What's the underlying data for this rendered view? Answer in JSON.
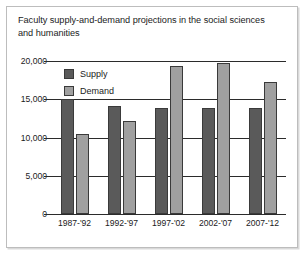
{
  "figure": {
    "title": "Faculty supply-and-demand projections in the social sciences and humanities"
  },
  "legend": {
    "position": "inside-top-left",
    "entries": [
      {
        "label": "Supply",
        "color": "#5a5a5a"
      },
      {
        "label": "Demand",
        "color": "#a0a0a0"
      }
    ]
  },
  "axes": {
    "y_tick_labels": [
      "20,000",
      "15,000",
      "10,000",
      "5,000",
      "0"
    ],
    "x_tick_labels": [
      "1987-'92",
      "1992-'97",
      "1997-'02",
      "2002-'07",
      "2007-'12"
    ]
  },
  "colors": {
    "supply": "#5a5a5a",
    "demand": "#a0a0a0",
    "bar_outline": "#3a3a3a",
    "axis": "#2b2b2b",
    "text": "#1b1b1b",
    "card_border": "#bdbdbd",
    "background": "#ffffff"
  },
  "chart_data": {
    "type": "bar",
    "title": "Faculty supply-and-demand projections in the social sciences and humanities",
    "xlabel": "",
    "ylabel": "",
    "ylim": [
      0,
      20000
    ],
    "yticks": [
      0,
      5000,
      10000,
      15000,
      20000
    ],
    "grid": true,
    "legend_position": "inside-top-left",
    "categories": [
      "1987-'92",
      "1992-'97",
      "1997-'02",
      "2002-'07",
      "2007-'12"
    ],
    "series": [
      {
        "name": "Supply",
        "color": "#5a5a5a",
        "values": [
          15000,
          14100,
          13800,
          13800,
          13900
        ]
      },
      {
        "name": "Demand",
        "color": "#a0a0a0",
        "values": [
          10500,
          12100,
          19300,
          19700,
          17300
        ]
      }
    ]
  }
}
